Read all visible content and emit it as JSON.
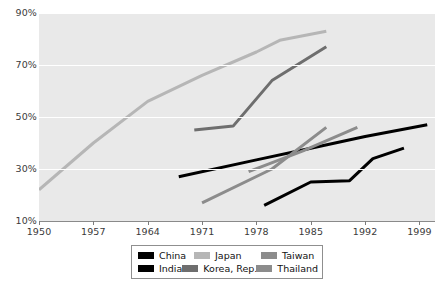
{
  "chart_data": {
    "type": "line",
    "title": "",
    "subtitle": "",
    "xlabel": "",
    "ylabel": "",
    "xlim": [
      1950,
      2001
    ],
    "ylim": [
      10,
      90
    ],
    "xticks": [
      1950,
      1957,
      1964,
      1971,
      1978,
      1985,
      1992,
      1999
    ],
    "xtick_labels": [
      "1950",
      "1957",
      "1964",
      "1971",
      "1978",
      "1985",
      "1992",
      "1999"
    ],
    "yticks": [
      10,
      30,
      50,
      70,
      90
    ],
    "ytick_labels": [
      "10%",
      "30%",
      "50%",
      "70%",
      "90%"
    ],
    "grid": "horizontal-white",
    "legend_position": "below-center",
    "plot_background": "#e9e9e9",
    "series": [
      {
        "name": "China",
        "color": "#000000",
        "x": [
          1968,
          1978,
          1985,
          1992,
          2000
        ],
        "y": [
          27,
          33.5,
          38,
          42.5,
          47
        ]
      },
      {
        "name": "India",
        "color": "#000000",
        "x": [
          1979,
          1985,
          1990,
          1993,
          1997
        ],
        "y": [
          16,
          25,
          25.5,
          34,
          38
        ]
      },
      {
        "name": "Japan",
        "color": "#b6b6b6",
        "x": [
          1950,
          1957,
          1964,
          1971,
          1978,
          1981,
          1987
        ],
        "y": [
          22,
          40,
          56,
          66,
          75,
          79.5,
          83
        ]
      },
      {
        "name": "Korea, Rep.",
        "color": "#6e6e6e",
        "x": [
          1970,
          1975,
          1980,
          1987
        ],
        "y": [
          45,
          46.5,
          64,
          77
        ]
      },
      {
        "name": "Taiwan",
        "color": "#8c8c8c",
        "x": [
          1971,
          1980,
          1987
        ],
        "y": [
          17,
          30,
          46
        ]
      },
      {
        "name": "Thailand",
        "color": "#8c8c8c",
        "x": [
          1977,
          1984,
          1991
        ],
        "y": [
          29,
          37,
          46
        ]
      }
    ]
  },
  "legend": {
    "rows": [
      [
        {
          "label": "China",
          "color": "#000000"
        },
        {
          "label": "Japan",
          "color": "#b6b6b6"
        },
        {
          "label": "Taiwan",
          "color": "#8c8c8c"
        }
      ],
      [
        {
          "label": "India",
          "color": "#000000"
        },
        {
          "label": "Korea, Rep.",
          "color": "#6e6e6e"
        },
        {
          "label": "Thailand",
          "color": "#8c8c8c"
        }
      ]
    ]
  }
}
